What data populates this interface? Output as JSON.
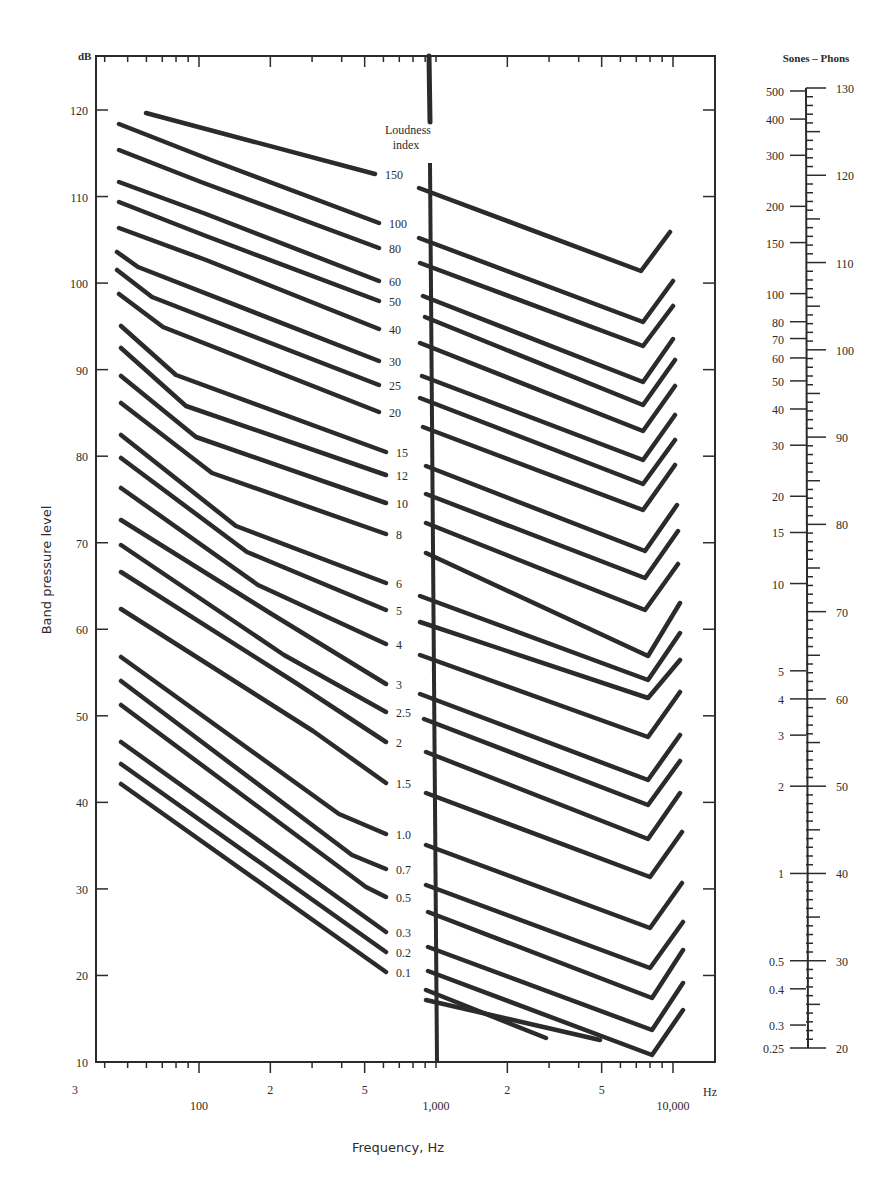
{
  "chart_data": {
    "type": "line",
    "xlabel": "Frequency, Hz",
    "ylabel": "Band pressure level",
    "y_unit_label": "dB",
    "x_unit_label": "Hz",
    "ylim": [
      10,
      125
    ],
    "xlim_hz": [
      22,
      17000
    ],
    "y_ticks": [
      10,
      20,
      30,
      40,
      50,
      60,
      70,
      80,
      90,
      100,
      110,
      120
    ],
    "x_tick_labels": [
      {
        "label": "3",
        "hz": 30
      },
      {
        "label": "100",
        "hz": 100
      },
      {
        "label": "2",
        "hz": 200
      },
      {
        "label": "5",
        "hz": 500
      },
      {
        "label": "1,000",
        "hz": 1000
      },
      {
        "label": "2",
        "hz": 2000
      },
      {
        "label": "5",
        "hz": 5000
      },
      {
        "label": "10,000",
        "hz": 10000
      }
    ],
    "center_label": "Loudness index",
    "grid": false,
    "legend": "inline labels along central axis",
    "series_note": "Each contour: left segment (low frequencies, ending near 700 Hz), right segment (from ~1 kHz, with an upturn above ~8 kHz). Points are [x_px, y_px] in the 895x1182 image.",
    "series": [
      {
        "name": "150",
        "left": [
          [
            146,
            113
          ],
          [
            375,
            174
          ]
        ],
        "right": [
          [
            419,
            188
          ],
          [
            641,
            271
          ],
          [
            670,
            232
          ]
        ]
      },
      {
        "name": "100",
        "left": [
          [
            119,
            124
          ],
          [
            211,
            160
          ],
          [
            379,
            223
          ]
        ],
        "right": [
          [
            419,
            238
          ],
          [
            643,
            322
          ],
          [
            673,
            281
          ]
        ]
      },
      {
        "name": "80",
        "left": [
          [
            119,
            150
          ],
          [
            201,
            182
          ],
          [
            379,
            248
          ]
        ],
        "right": [
          [
            420,
            263
          ],
          [
            643,
            346
          ],
          [
            673,
            306
          ]
        ]
      },
      {
        "name": "60",
        "left": [
          [
            119,
            182
          ],
          [
            206,
            214
          ],
          [
            379,
            281
          ]
        ],
        "right": [
          [
            423,
            296
          ],
          [
            643,
            382
          ],
          [
            673,
            339
          ]
        ]
      },
      {
        "name": "50",
        "left": [
          [
            119,
            202
          ],
          [
            206,
            236
          ],
          [
            379,
            301
          ]
        ],
        "right": [
          [
            425,
            317
          ],
          [
            643,
            405
          ],
          [
            675,
            360
          ]
        ]
      },
      {
        "name": "40",
        "left": [
          [
            119,
            228
          ],
          [
            206,
            260
          ],
          [
            379,
            329
          ]
        ],
        "right": [
          [
            420,
            343
          ],
          [
            643,
            431
          ],
          [
            675,
            386
          ]
        ]
      },
      {
        "name": "30",
        "left": [
          [
            117,
            252
          ],
          [
            138,
            267
          ],
          [
            379,
            361
          ]
        ],
        "right": [
          [
            422,
            376
          ],
          [
            643,
            460
          ],
          [
            675,
            415
          ]
        ]
      },
      {
        "name": "25",
        "left": [
          [
            117,
            270
          ],
          [
            152,
            297
          ],
          [
            379,
            385
          ]
        ],
        "right": [
          [
            420,
            398
          ],
          [
            643,
            484
          ],
          [
            675,
            440
          ]
        ]
      },
      {
        "name": "20",
        "left": [
          [
            119,
            294
          ],
          [
            163,
            327
          ],
          [
            379,
            412
          ]
        ],
        "right": [
          [
            423,
            427
          ],
          [
            643,
            510
          ],
          [
            675,
            465
          ]
        ]
      },
      {
        "name": "15",
        "left": [
          [
            121,
            326
          ],
          [
            176,
            375
          ],
          [
            386,
            452
          ]
        ],
        "right": [
          [
            426,
            466
          ],
          [
            645,
            551
          ],
          [
            677,
            505
          ]
        ]
      },
      {
        "name": "12",
        "left": [
          [
            121,
            348
          ],
          [
            186,
            406
          ],
          [
            386,
            475
          ]
        ],
        "right": [
          [
            426,
            494
          ],
          [
            645,
            578
          ],
          [
            678,
            531
          ]
        ]
      },
      {
        "name": "10",
        "left": [
          [
            121,
            376
          ],
          [
            196,
            437
          ],
          [
            386,
            503
          ]
        ],
        "right": [
          [
            426,
            523
          ],
          [
            645,
            610
          ],
          [
            678,
            564
          ]
        ]
      },
      {
        "name": "8",
        "left": [
          [
            121,
            403
          ],
          [
            212,
            473
          ],
          [
            386,
            534
          ]
        ],
        "right": [
          [
            426,
            553
          ],
          [
            648,
            656
          ],
          [
            680,
            603
          ]
        ]
      },
      {
        "name": "6",
        "left": [
          [
            121,
            435
          ],
          [
            236,
            526
          ],
          [
            386,
            583
          ]
        ],
        "right": [
          [
            420,
            596
          ],
          [
            648,
            680
          ],
          [
            680,
            633
          ]
        ]
      },
      {
        "name": "5",
        "left": [
          [
            121,
            458
          ],
          [
            247,
            552
          ],
          [
            386,
            610
          ]
        ],
        "right": [
          [
            420,
            622
          ],
          [
            648,
            698
          ],
          [
            680,
            660
          ]
        ]
      },
      {
        "name": "4",
        "left": [
          [
            121,
            488
          ],
          [
            258,
            585
          ],
          [
            386,
            644
          ]
        ],
        "right": [
          [
            420,
            655
          ],
          [
            648,
            737
          ],
          [
            680,
            692
          ]
        ]
      },
      {
        "name": "3",
        "left": [
          [
            121,
            520
          ],
          [
            270,
            613
          ],
          [
            386,
            684
          ]
        ],
        "right": [
          [
            420,
            694
          ],
          [
            648,
            780
          ],
          [
            680,
            735
          ]
        ]
      },
      {
        "name": "2.5",
        "left": [
          [
            121,
            545
          ],
          [
            284,
            655
          ],
          [
            386,
            712
          ]
        ],
        "right": [
          [
            424,
            719
          ],
          [
            648,
            805
          ],
          [
            680,
            761
          ]
        ]
      },
      {
        "name": "2",
        "left": [
          [
            121,
            572
          ],
          [
            296,
            683
          ],
          [
            386,
            742
          ]
        ],
        "right": [
          [
            426,
            752
          ],
          [
            648,
            839
          ],
          [
            680,
            793
          ]
        ]
      },
      {
        "name": "1.5",
        "left": [
          [
            121,
            609
          ],
          [
            313,
            731
          ],
          [
            386,
            783
          ]
        ],
        "right": [
          [
            426,
            793
          ],
          [
            650,
            877
          ],
          [
            682,
            832
          ]
        ]
      },
      {
        "name": "1.0",
        "left": [
          [
            121,
            657
          ],
          [
            339,
            814
          ],
          [
            386,
            834
          ]
        ],
        "right": [
          [
            426,
            845
          ],
          [
            650,
            928
          ],
          [
            682,
            883
          ]
        ]
      },
      {
        "name": "0.7",
        "left": [
          [
            121,
            681
          ],
          [
            352,
            855
          ],
          [
            386,
            869
          ]
        ],
        "right": [
          [
            426,
            885
          ],
          [
            650,
            968
          ],
          [
            683,
            922
          ]
        ]
      },
      {
        "name": "0.5",
        "left": [
          [
            121,
            705
          ],
          [
            366,
            887
          ],
          [
            386,
            897
          ]
        ],
        "right": [
          [
            428,
            912
          ],
          [
            652,
            998
          ],
          [
            683,
            950
          ]
        ]
      },
      {
        "name": "0.3",
        "left": [
          [
            121,
            742
          ],
          [
            386,
            932
          ]
        ],
        "right": [
          [
            428,
            947
          ],
          [
            652,
            1030
          ],
          [
            683,
            983
          ]
        ]
      },
      {
        "name": "0.2",
        "left": [
          [
            121,
            764
          ],
          [
            386,
            952
          ]
        ],
        "right": [
          [
            428,
            971
          ],
          [
            652,
            1055
          ],
          [
            683,
            1010
          ]
        ]
      },
      {
        "name": "0.1",
        "left": [
          [
            121,
            784
          ],
          [
            386,
            972
          ]
        ],
        "right": [
          [
            426,
            990
          ],
          [
            546,
            1038
          ]
        ]
      },
      {
        "name": "(lowest)",
        "left": [],
        "right": [
          [
            426,
            1000
          ],
          [
            600,
            1040
          ]
        ]
      }
    ],
    "sones_phons_scale": {
      "title": "Sones – Phons",
      "sones_labels": [
        "500",
        "400",
        "300",
        "200",
        "150",
        "100",
        "80",
        "70",
        "60",
        "50",
        "40",
        "30",
        "20",
        "15",
        "10",
        "5",
        "4",
        "3",
        "2",
        "1",
        "0.5",
        "0.4",
        "0.3",
        "0.25"
      ],
      "phons_labels": [
        "130",
        "120",
        "110",
        "100",
        "90",
        "80",
        "70",
        "60",
        "50",
        "40",
        "30",
        "20"
      ]
    }
  },
  "labels": {
    "db_unit": "dB",
    "hz_unit": "Hz",
    "y_axis_title": "Band pressure level",
    "x_axis_title": "Frequency, Hz",
    "loudness_title_1": "Loudness",
    "loudness_title_2": "index",
    "scale_title": "Sones – Phons"
  },
  "colors": {
    "ink": "#2b2b2b",
    "background": "#ffffff"
  }
}
